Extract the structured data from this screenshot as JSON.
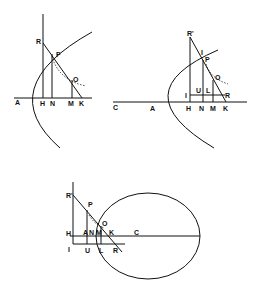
{
  "figures": [
    {
      "id": "parabola-left",
      "labels": {
        "R": "R",
        "P": "P",
        "O": "O",
        "A": "A",
        "H": "H",
        "N": "N",
        "M": "M",
        "K": "K"
      }
    },
    {
      "id": "parabola-right",
      "labels": {
        "R_prime": "R'",
        "I_top": "I",
        "P": "P",
        "O": "O",
        "C": "C",
        "A": "A",
        "I": "I",
        "U": "U",
        "L": "L",
        "R": "R",
        "H": "H",
        "N": "N",
        "M": "M",
        "K": "K"
      }
    },
    {
      "id": "ellipse-bottom",
      "labels": {
        "R_prime": "R'",
        "P": "P",
        "O": "O",
        "H": "H",
        "A": "A",
        "N": "N",
        "M": "M",
        "K": "K",
        "C": "C",
        "I": "I",
        "U": "U",
        "L": "L",
        "R": "R"
      }
    }
  ]
}
